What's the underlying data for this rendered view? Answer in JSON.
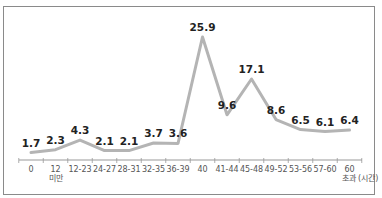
{
  "chart_data": {
    "type": "line",
    "title": "",
    "xlabel": "(시간)",
    "ylabel": "",
    "categories": [
      "0",
      "12 미만",
      "12-23",
      "24-27",
      "28-31",
      "32-35",
      "36-39",
      "40",
      "41-44",
      "45-48",
      "49-52",
      "53-56",
      "57-60",
      "60 초과"
    ],
    "values": [
      1.7,
      2.3,
      4.3,
      2.1,
      2.1,
      3.7,
      3.6,
      25.9,
      9.6,
      17.1,
      8.6,
      6.5,
      6.1,
      6.4
    ],
    "value_labels": [
      "1.7",
      "2.3",
      "4.3",
      "2.1",
      "2.1",
      "3.7",
      "3.6",
      "25.9",
      "9.6",
      "17.1",
      "8.6",
      "6.5",
      "6.1",
      "6.4"
    ],
    "tick_labels": [
      {
        "line1": "0",
        "line2": ""
      },
      {
        "line1": "12",
        "line2": "미만"
      },
      {
        "line1": "12-23",
        "line2": ""
      },
      {
        "line1": "24-27",
        "line2": ""
      },
      {
        "line1": "28-31",
        "line2": ""
      },
      {
        "line1": "32-35",
        "line2": ""
      },
      {
        "line1": "36-39",
        "line2": ""
      },
      {
        "line1": "40",
        "line2": ""
      },
      {
        "line1": "41-44",
        "line2": ""
      },
      {
        "line1": "45-48",
        "line2": ""
      },
      {
        "line1": "49-52",
        "line2": ""
      },
      {
        "line1": "53-56",
        "line2": ""
      },
      {
        "line1": "57-60",
        "line2": ""
      },
      {
        "line1": "60",
        "line2": "초과 (시간)"
      }
    ],
    "line_color": "#b4b4b4",
    "grid": false,
    "legend": null,
    "ylim": [
      0,
      28
    ]
  }
}
